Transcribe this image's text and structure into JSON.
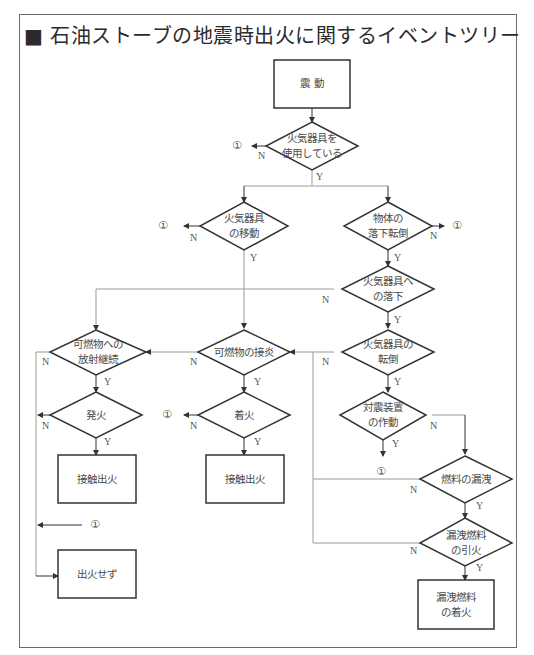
{
  "title": "■ 石油ストーブの地震時出火に関するイベントツリー",
  "nodes": {
    "start": "震 動",
    "q_use": [
      "火気器具を",
      "使用している"
    ],
    "q_move": [
      "火気器具",
      "の移動"
    ],
    "q_fall_obj": [
      "物体の",
      "落下転倒"
    ],
    "q_fall_onto": [
      "火気器具へ",
      "の落下"
    ],
    "q_radiant": [
      "可燃物への",
      "放射継続"
    ],
    "q_contact": [
      "可燃物の接炎"
    ],
    "q_tip": [
      "火気器具の",
      "転倒"
    ],
    "q_safety": [
      "対震装置",
      "の作動"
    ],
    "q_ignite1": [
      "発火"
    ],
    "q_ignite2": [
      "着火"
    ],
    "q_leak": [
      "燃料の漏洩"
    ],
    "q_leak_ignite": [
      "漏洩燃料",
      "の引火"
    ],
    "out_contact1": "接触出火",
    "out_contact2": "接触出火",
    "out_none": "出火せず",
    "out_leak": [
      "漏洩燃料",
      "の着火"
    ]
  },
  "labels": {
    "yes": "Y",
    "no": "N",
    "ref": "①"
  }
}
